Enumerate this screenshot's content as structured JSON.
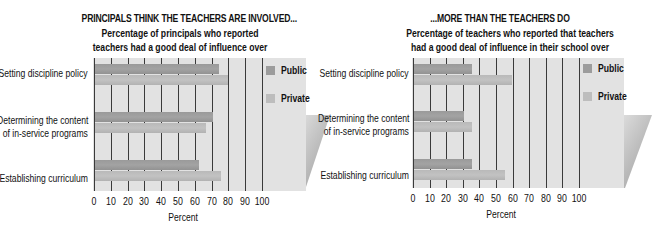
{
  "chart_data": [
    {
      "type": "bar",
      "orientation": "horizontal",
      "title": "PRINCIPALS THINK THE TEACHERS ARE INVOLVED...",
      "subtitle": [
        "Percentage of principals who reported",
        "teachers had a good deal of influence over"
      ],
      "categories": [
        "Setting discipline policy",
        "Determining the content of in-service programs",
        "Establishing curriculum"
      ],
      "category_lines": [
        [
          "Setting discipline policy"
        ],
        [
          "Determining the content",
          "of in-service programs"
        ],
        [
          "Establishing curriculum"
        ]
      ],
      "series": [
        {
          "name": "Public",
          "values": [
            74,
            70,
            62
          ],
          "color": "#9c9c9c"
        },
        {
          "name": "Private",
          "values": [
            79,
            66,
            75
          ],
          "color": "#bdbdbd"
        }
      ],
      "xlabel": "Percent",
      "ylabel": "",
      "xticks": [
        "0",
        "10",
        "20",
        "30",
        "40",
        "50",
        "60",
        "70",
        "80",
        "90",
        "100"
      ],
      "xlim": [
        0,
        100
      ],
      "grid": true,
      "legend_position": "right"
    },
    {
      "type": "bar",
      "orientation": "horizontal",
      "title": "...MORE THAN THE TEACHERS DO",
      "subtitle": [
        "Percentage of teachers who reported that teachers",
        "had a good deal of influence in their school over"
      ],
      "categories": [
        "Setting discipline policy",
        "Determining the content of in-service programs",
        "Establishing curriculum"
      ],
      "category_lines": [
        [
          "Setting discipline policy"
        ],
        [
          "Determining the content",
          "of in-service programs"
        ],
        [
          "Establishing curriculum"
        ]
      ],
      "series": [
        {
          "name": "Public",
          "values": [
            35,
            30,
            35
          ],
          "color": "#9c9c9c"
        },
        {
          "name": "Private",
          "values": [
            59,
            35,
            55
          ],
          "color": "#bdbdbd"
        }
      ],
      "xlabel": "Percent",
      "ylabel": "",
      "xticks": [
        "0",
        "10",
        "20",
        "30",
        "40",
        "50",
        "60",
        "70",
        "80",
        "90",
        "100"
      ],
      "xlim": [
        0,
        100
      ],
      "grid": true,
      "legend_position": "right"
    }
  ],
  "colors": {
    "panel_bg": "#e2e2e2",
    "gridline": "#3a3a3a",
    "public": "#9c9c9c",
    "private": "#bdbdbd"
  }
}
